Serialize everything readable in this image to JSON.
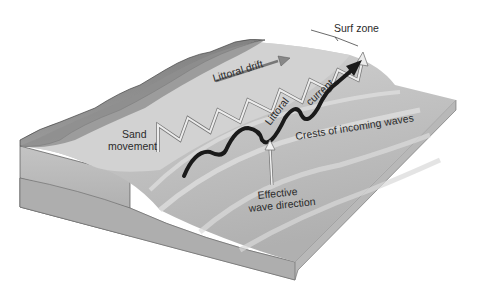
{
  "diagram": {
    "labels": {
      "surf_zone": "Surf zone",
      "littoral_drift": "Littoral drift",
      "sand_movement_line1": "Sand",
      "sand_movement_line2": "movement",
      "littoral_current_line1": "Littoral",
      "littoral_current_line2": "current",
      "crests": "Crests of incoming waves",
      "effective_line1": "Effective",
      "effective_line2": "wave direction"
    },
    "colors": {
      "background": "#ffffff",
      "land": "#8c8c8c",
      "beach": "#d4d4d4",
      "sea_surface": "#c2c2c2",
      "block_side": "#b5b5b5",
      "current_arrow": "#1a1a1a",
      "sand_arrows": "#e8e8e8"
    }
  }
}
